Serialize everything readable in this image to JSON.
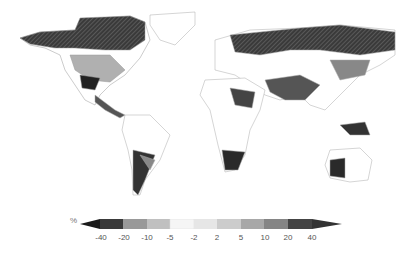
{
  "map": {
    "title": "",
    "style": "grayscale world map of percentage change",
    "regions_dark": [
      "Canada/Alaska",
      "northern Russia/Siberia",
      "Sahel",
      "southern Africa",
      "western Australia",
      "southern South America",
      "India",
      "Mexico"
    ],
    "regions_light": [
      "Greenland",
      "Amazon",
      "Sahara",
      "Central Asia"
    ]
  },
  "colorbar": {
    "unit": "%",
    "ticks": [
      "-40",
      "-20",
      "-10",
      "-5",
      "-2",
      "2",
      "5",
      "10",
      "20",
      "40"
    ],
    "colors": [
      "#2a2a2a",
      "#555555",
      "#8c8c8c",
      "#b8b8b8",
      "#f7f7f7",
      "#e4e4e4",
      "#c4c4c4",
      "#a0a0a0",
      "#7a7a7a",
      "#3e3e3e",
      "#2a2a2a"
    ]
  }
}
